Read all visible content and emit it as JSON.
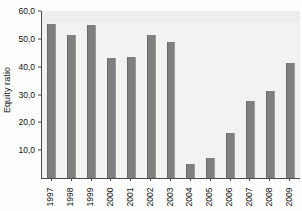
{
  "chart_data": {
    "type": "bar",
    "title": "",
    "xlabel": "",
    "ylabel": "Equity ratio",
    "categories": [
      "1997",
      "1998",
      "1999",
      "2000",
      "2001",
      "2002",
      "2003",
      "2004",
      "2005",
      "2006",
      "2007",
      "2008",
      "2009"
    ],
    "values": [
      55.2,
      51.3,
      54.9,
      43.0,
      43.5,
      51.3,
      48.7,
      5.1,
      7.2,
      16.2,
      27.8,
      31.4,
      41.5
    ],
    "ylim": [
      0,
      60
    ],
    "yticks": [
      10,
      20,
      30,
      40,
      50,
      60
    ],
    "ytick_labels": [
      "10,0",
      "20,0",
      "30,0",
      "40,0",
      "50,0",
      "60,0"
    ],
    "grid": false,
    "legend": "none",
    "bar_color": "#7f7f7f",
    "plot_background": "#f2f2f1",
    "axis_color": "#4a4a4a",
    "text_color": "#111111"
  }
}
